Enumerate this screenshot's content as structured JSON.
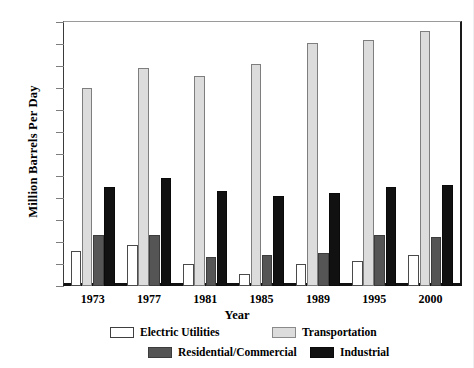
{
  "chart_data": {
    "type": "bar",
    "title": "",
    "xlabel": "Year",
    "ylabel": "Million Barrels Per Day",
    "categories": [
      "1973",
      "1977",
      "1981",
      "1985",
      "1989",
      "1995",
      "2000"
    ],
    "ylim": [
      0,
      12
    ],
    "yticks": [
      0,
      1,
      2,
      3,
      4,
      5,
      6,
      7,
      8,
      9,
      10,
      11,
      12
    ],
    "ytick_labels": [
      "0",
      "1",
      "2",
      "3",
      "4",
      "5",
      "6",
      "7",
      "8",
      "9",
      "10",
      "11",
      "12"
    ],
    "grid": false,
    "legend_position": "bottom",
    "series": [
      {
        "name": "Electric Utilities",
        "color": "#ffffff",
        "values": [
          1.6,
          1.85,
          1.0,
          0.55,
          1.0,
          1.15,
          1.4
        ]
      },
      {
        "name": "Transportation",
        "color": "#dcdcdc",
        "values": [
          9.0,
          9.9,
          9.55,
          10.1,
          11.05,
          11.2,
          11.6
        ]
      },
      {
        "name": "Residential/Commercial",
        "color": "#555555",
        "values": [
          2.3,
          2.3,
          1.3,
          1.4,
          1.5,
          2.3,
          2.25
        ]
      },
      {
        "name": "Industrial",
        "color": "#111111",
        "values": [
          4.5,
          4.9,
          4.3,
          4.1,
          4.25,
          4.5,
          4.6
        ]
      }
    ]
  }
}
